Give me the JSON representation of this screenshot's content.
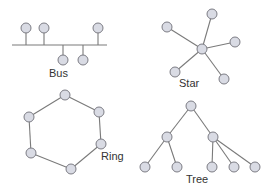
{
  "diagram": {
    "colors": {
      "node_fill": "#d9dbe4",
      "node_stroke": "#7c7c84",
      "link": "#7a7a7a",
      "text": "#333333"
    },
    "node_radius": 5,
    "topologies": [
      {
        "name": "bus",
        "label": "Bus",
        "label_pos": [
          49,
          77
        ],
        "backbone": [
          [
            12,
            45
          ],
          [
            107,
            45
          ]
        ],
        "nodes": [
          [
            26,
            28
          ],
          [
            44,
            28
          ],
          [
            98,
            28
          ],
          [
            63,
            60
          ],
          [
            83,
            60
          ]
        ],
        "drops": [
          [
            26,
            45
          ],
          [
            44,
            45
          ],
          [
            98,
            45
          ],
          [
            63,
            45
          ],
          [
            83,
            45
          ]
        ]
      },
      {
        "name": "star",
        "label": "Star",
        "label_pos": [
          179,
          87
        ],
        "hub": [
          202,
          49
        ],
        "nodes": [
          [
            167,
            27
          ],
          [
            212,
            14
          ],
          [
            235,
            42
          ],
          [
            175,
            72
          ],
          [
            224,
            79
          ]
        ]
      },
      {
        "name": "ring",
        "label": "Ring",
        "label_pos": [
          101,
          160
        ],
        "nodes": [
          [
            65,
            95
          ],
          [
            99,
            112
          ],
          [
            101,
            144
          ],
          [
            71,
            169
          ],
          [
            31,
            153
          ],
          [
            29,
            117
          ]
        ]
      },
      {
        "name": "tree",
        "label": "Tree",
        "label_pos": [
          186,
          183
        ],
        "nodes": [
          [
            191,
            106
          ],
          [
            167,
            137
          ],
          [
            213,
            137
          ],
          [
            145,
            167
          ],
          [
            177,
            167
          ],
          [
            212,
            167
          ],
          [
            234,
            167
          ],
          [
            255,
            167
          ]
        ],
        "edges": [
          [
            0,
            1
          ],
          [
            0,
            2
          ],
          [
            1,
            3
          ],
          [
            1,
            4
          ],
          [
            2,
            5
          ],
          [
            2,
            6
          ],
          [
            2,
            7
          ]
        ]
      }
    ]
  }
}
